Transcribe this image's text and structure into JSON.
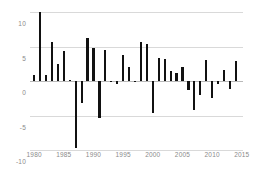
{
  "chart_data": {
    "type": "bar",
    "title": "",
    "subtitle": "",
    "xlabel": "",
    "ylabel": "",
    "grid": true,
    "legend": null,
    "xlim": [
      1979.3,
      2015.2
    ],
    "ylim": [
      -10,
      10
    ],
    "yticks": [
      10,
      5,
      0,
      -5,
      -10
    ],
    "ytick_labels": [
      "10",
      "5",
      "0",
      "-5",
      "-10"
    ],
    "xticks": [
      1980,
      1985,
      1990,
      1995,
      2000,
      2005,
      2010,
      2015
    ],
    "xtick_labels": [
      "1980",
      "1985",
      "1990",
      "1995",
      "2000",
      "2005",
      "2010",
      "2015"
    ],
    "bar_color": "#111111",
    "grid_color": "#d9d9d9",
    "axis_text_color": "#8a8a8a",
    "categories": [
      1980,
      1981,
      1982,
      1983,
      1984,
      1985,
      1986,
      1987,
      1988,
      1989,
      1990,
      1991,
      1992,
      1993,
      1994,
      1995,
      1996,
      1997,
      1998,
      1999,
      2000,
      2001,
      2002,
      2003,
      2004,
      2005,
      2006,
      2007,
      2008,
      2009,
      2010,
      2011,
      2012,
      2013,
      2014
    ],
    "values": [
      0.8,
      10.0,
      0.9,
      5.6,
      2.5,
      4.4,
      0.2,
      -9.7,
      -3.2,
      6.3,
      4.8,
      -5.4,
      4.5,
      -0.1,
      -0.4,
      3.8,
      2.0,
      -0.1,
      5.6,
      5.4,
      -4.6,
      3.3,
      3.2,
      1.5,
      1.1,
      2.1,
      -1.3,
      -4.2,
      -2.0,
      3.0,
      -2.5,
      -0.5,
      1.6,
      -1.2,
      2.9
    ]
  }
}
